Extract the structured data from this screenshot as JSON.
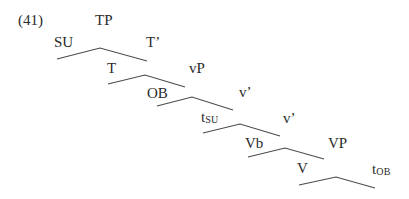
{
  "example_number": "(41)",
  "tree": {
    "nodes": [
      {
        "id": "TP",
        "label": "TP",
        "x": 95,
        "y": 13
      },
      {
        "id": "SU",
        "label": "SU",
        "x": 54,
        "y": 35
      },
      {
        "id": "Tbar",
        "label": "T’",
        "x": 146,
        "y": 35
      },
      {
        "id": "T",
        "label": "T",
        "x": 107,
        "y": 61
      },
      {
        "id": "vP",
        "label": "vP",
        "x": 189,
        "y": 61
      },
      {
        "id": "OB",
        "label": "OB",
        "x": 147,
        "y": 86
      },
      {
        "id": "vbar1",
        "label": "v’",
        "x": 239,
        "y": 85
      },
      {
        "id": "tSU",
        "label": "t",
        "sub": "SU",
        "x": 201,
        "y": 111
      },
      {
        "id": "vbar2",
        "label": "v’",
        "x": 283,
        "y": 111
      },
      {
        "id": "Vb",
        "label": "Vb",
        "x": 245,
        "y": 136
      },
      {
        "id": "VP",
        "label": "VP",
        "x": 328,
        "y": 136
      },
      {
        "id": "V",
        "label": "V",
        "x": 297,
        "y": 161
      },
      {
        "id": "tOB",
        "label": "t",
        "sub": "OB",
        "x": 372,
        "y": 163
      }
    ],
    "branches": [
      {
        "parent": "TP",
        "children": [
          "SU",
          "Tbar"
        ],
        "points": "57,59 100,48 147,61"
      },
      {
        "parent": "Tbar",
        "children": [
          "T",
          "vP"
        ],
        "points": "108,84 145,75 185,87"
      },
      {
        "parent": "vP",
        "children": [
          "OB",
          "vbar1"
        ],
        "points": "157,106 192,97 233,110"
      },
      {
        "parent": "vbar1",
        "children": [
          "tSU",
          "vbar2"
        ],
        "points": "203,133 240,124 280,136"
      },
      {
        "parent": "vbar2",
        "children": [
          "Vb",
          "VP"
        ],
        "points": "248,157 285,148 324,159"
      },
      {
        "parent": "VP",
        "children": [
          "V",
          "tOB"
        ],
        "points": "299,185 336,177 375,188"
      }
    ]
  },
  "labels": {
    "TP": "TP",
    "SU": "SU",
    "Tbar": "T’",
    "T": "T",
    "vP": "vP",
    "OB": "OB",
    "vbar1": "v’",
    "tSU_base": "t",
    "tSU_sub": "SU",
    "vbar2": "v’",
    "Vb": "Vb",
    "VP": "VP",
    "V": "V",
    "tOB_base": "t",
    "tOB_sub": "OB"
  }
}
